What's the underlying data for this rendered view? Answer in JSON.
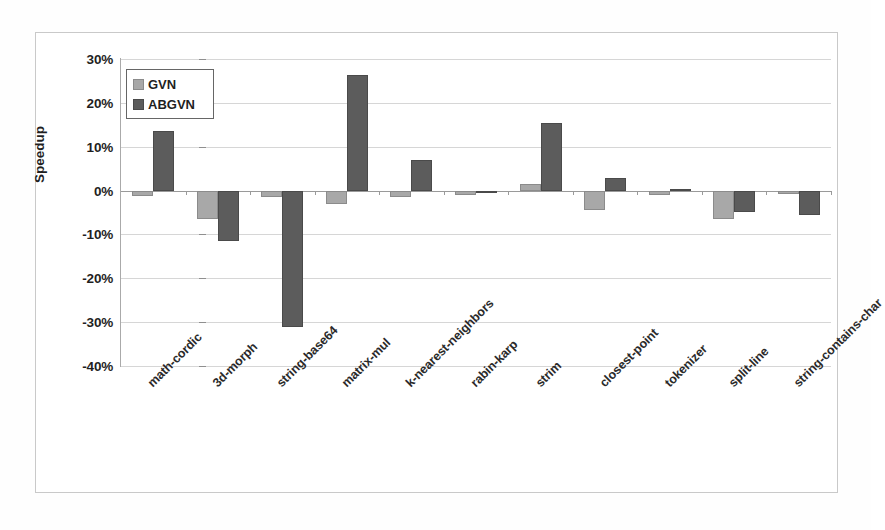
{
  "chart_data": {
    "type": "bar",
    "title": "",
    "xlabel": "",
    "ylabel": "Speedup",
    "ylim": [
      -40,
      30
    ],
    "ytick_step": 10,
    "grid": true,
    "legend_position": "top-left-inside",
    "yticks": [
      "30%",
      "20%",
      "10%",
      "0%",
      "-10%",
      "-20%",
      "-30%",
      "-40%"
    ],
    "categories": [
      "math-cordic",
      "3d-morph",
      "string-base64",
      "matrix-mul",
      "k-nearest-neighbors",
      "rabin-karp",
      "strim",
      "closest-point",
      "tokenizer",
      "split-line",
      "string-contains-char"
    ],
    "series": [
      {
        "name": "GVN",
        "color": "#a8a8a8",
        "values": [
          -1.2,
          -6.5,
          -1.5,
          -3.0,
          -1.5,
          -1.0,
          1.5,
          -4.5,
          -0.9,
          -6.5,
          -0.8
        ]
      },
      {
        "name": "ABGVN",
        "color": "#5c5c5c",
        "values": [
          13.5,
          -11.5,
          -31.0,
          26.3,
          7.0,
          -0.6,
          15.5,
          2.8,
          0.3,
          -5.0,
          -5.5
        ]
      }
    ]
  },
  "legend": {
    "items": [
      {
        "label": "GVN"
      },
      {
        "label": "ABGVN"
      }
    ]
  },
  "colors": {
    "gvn": "#a8a8a8",
    "abgvn": "#5c5c5c",
    "gridline": "#d6d6d6",
    "axis": "#9a9a9a",
    "frame": "#c9c9c9"
  }
}
